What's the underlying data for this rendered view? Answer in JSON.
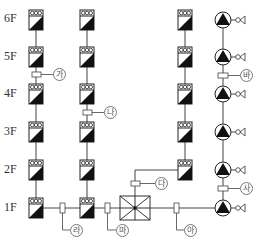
{
  "floors": [
    "6F",
    "5F",
    "4F",
    "3F",
    "2F",
    "1F"
  ],
  "tags": {
    "ga": "가",
    "na": "나",
    "da": "다",
    "ra": "라",
    "ma": "마",
    "ba": "바",
    "sa": "사",
    "a": "아"
  },
  "columns": {
    "unit_column_1": {
      "floors": 6
    },
    "unit_column_2": {
      "floors": 6
    },
    "unit_column_3": {
      "floors": 5
    },
    "pump_column": {
      "pumps": 6
    }
  },
  "colors": {
    "line": "#444444",
    "fill": "#111111"
  }
}
